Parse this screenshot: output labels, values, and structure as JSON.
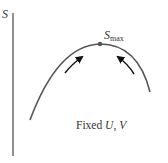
{
  "diagram": {
    "axis_label": "S",
    "max_label_main": "S",
    "max_label_sub": "max",
    "condition_prefix": "Fixed ",
    "condition_var1": "U",
    "condition_sep": ", ",
    "condition_var2": "V",
    "colors": {
      "curve": "#555555",
      "axis": "#555555",
      "arrows": "#111111",
      "text": "#333333",
      "background": "#ffffff"
    }
  }
}
